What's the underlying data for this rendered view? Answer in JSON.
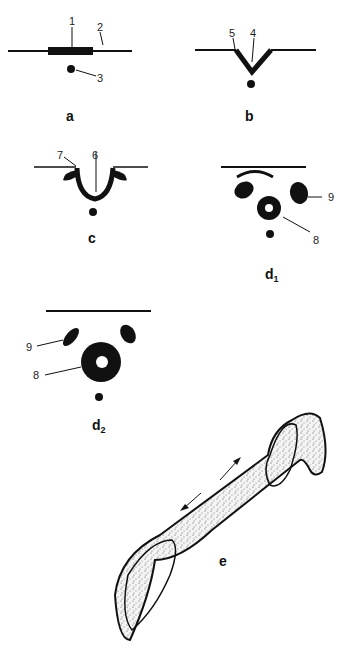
{
  "panels": {
    "a": {
      "label": "a",
      "callouts": [
        "1",
        "2",
        "3"
      ]
    },
    "b": {
      "label": "b",
      "callouts": [
        "5",
        "4"
      ]
    },
    "c": {
      "label": "c",
      "callouts": [
        "7",
        "6"
      ]
    },
    "d1": {
      "label": "d",
      "subscript": "1",
      "callouts": [
        "9",
        "8"
      ]
    },
    "d2": {
      "label": "d",
      "subscript": "2",
      "callouts": [
        "9",
        "8"
      ]
    },
    "e": {
      "label": "e"
    }
  },
  "colors": {
    "ink": "#111111",
    "background": "#ffffff",
    "stipple": "#555555"
  }
}
